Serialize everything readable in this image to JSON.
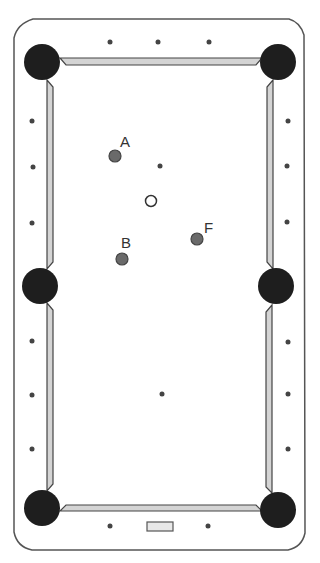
{
  "diagram": {
    "type": "pool-table",
    "colors": {
      "background": "#ffffff",
      "table_outline": "#555555",
      "rail_fill": "#d4d4d4",
      "rail_stroke": "#444444",
      "pocket": "#1e1e1e",
      "object_ball": "#6a6a6a",
      "object_ball_stroke": "#444444",
      "cue_ball_fill": "#ffffff",
      "cue_ball_stroke": "#333333",
      "diamond": "#444444",
      "label": "#333333"
    },
    "pockets": [
      {
        "name": "top-left",
        "cx": 42,
        "cy": 62
      },
      {
        "name": "top-right",
        "cx": 278,
        "cy": 62
      },
      {
        "name": "middle-left",
        "cx": 40,
        "cy": 286
      },
      {
        "name": "middle-right",
        "cx": 276,
        "cy": 286
      },
      {
        "name": "bottom-left",
        "cx": 42,
        "cy": 508
      },
      {
        "name": "bottom-right",
        "cx": 278,
        "cy": 510
      }
    ],
    "balls": [
      {
        "id": "A",
        "label": "A",
        "cx": 115,
        "cy": 156,
        "type": "object",
        "label_x": 120,
        "label_y": 147
      },
      {
        "id": "B",
        "label": "B",
        "cx": 122,
        "cy": 259,
        "type": "object",
        "label_x": 121,
        "label_y": 248
      },
      {
        "id": "F",
        "label": "F",
        "cx": 197,
        "cy": 239,
        "type": "object",
        "label_x": 204,
        "label_y": 233
      },
      {
        "id": "cue",
        "label": "",
        "cx": 151,
        "cy": 201,
        "type": "cue"
      }
    ],
    "spots": [
      {
        "name": "head-spot",
        "cx": 160,
        "cy": 166
      },
      {
        "name": "foot-spot",
        "cx": 162,
        "cy": 394
      }
    ],
    "diamonds": {
      "top": [
        {
          "cx": 110,
          "cy": 42
        },
        {
          "cx": 158,
          "cy": 42
        },
        {
          "cx": 209,
          "cy": 42
        }
      ],
      "bottom": [
        {
          "cx": 110,
          "cy": 526
        },
        {
          "cx": 208,
          "cy": 526
        }
      ],
      "left": [
        {
          "cx": 32,
          "cy": 121
        },
        {
          "cx": 33,
          "cy": 167
        },
        {
          "cx": 32,
          "cy": 223
        },
        {
          "cx": 32,
          "cy": 341
        },
        {
          "cx": 32,
          "cy": 395
        },
        {
          "cx": 32,
          "cy": 449
        }
      ],
      "right": [
        {
          "cx": 288,
          "cy": 121
        },
        {
          "cx": 287,
          "cy": 166
        },
        {
          "cx": 287,
          "cy": 222
        },
        {
          "cx": 288,
          "cy": 342
        },
        {
          "cx": 288,
          "cy": 394
        },
        {
          "cx": 288,
          "cy": 449
        }
      ]
    },
    "nameplate": {
      "x": 147,
      "y": 522,
      "width": 26,
      "height": 9
    }
  }
}
